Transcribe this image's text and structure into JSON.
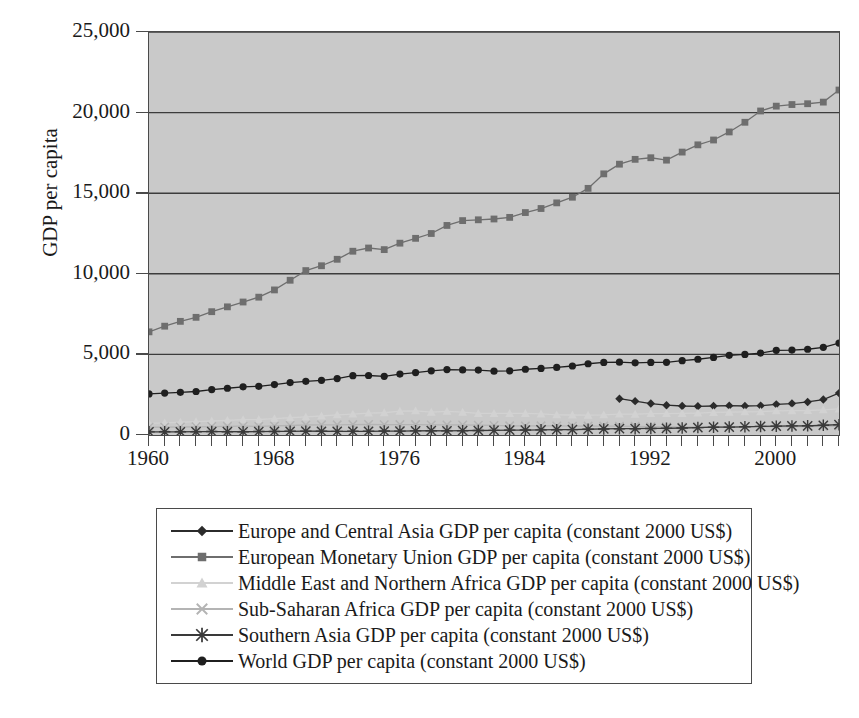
{
  "chart_data": {
    "type": "line",
    "title": "",
    "xlabel": "",
    "ylabel": "GDP per capita",
    "xlim": [
      1960,
      2004
    ],
    "ylim": [
      0,
      25000
    ],
    "grid": true,
    "legend_position": "bottom",
    "y_ticks": [
      "0",
      "5,000",
      "10,000",
      "15,000",
      "20,000",
      "25,000"
    ],
    "y_tick_values": [
      0,
      5000,
      10000,
      15000,
      20000,
      25000
    ],
    "x_ticks": [
      "1960",
      "1968",
      "1976",
      "1984",
      "1992",
      "2000"
    ],
    "x_tick_values": [
      1960,
      1968,
      1976,
      1984,
      1992,
      2000
    ],
    "x": [
      1960,
      1961,
      1962,
      1963,
      1964,
      1965,
      1966,
      1967,
      1968,
      1969,
      1970,
      1971,
      1972,
      1973,
      1974,
      1975,
      1976,
      1977,
      1978,
      1979,
      1980,
      1981,
      1982,
      1983,
      1984,
      1985,
      1986,
      1987,
      1988,
      1989,
      1990,
      1991,
      1992,
      1993,
      1994,
      1995,
      1996,
      1997,
      1998,
      1999,
      2000,
      2001,
      2002,
      2003,
      2004
    ],
    "series": [
      {
        "name": "Europe and Central Asia GDP per capita (constant 2000 US$)",
        "marker": "diamond",
        "color": "#2b2b2b",
        "start_year": 1990,
        "values": [
          null,
          null,
          null,
          null,
          null,
          null,
          null,
          null,
          null,
          null,
          null,
          null,
          null,
          null,
          null,
          null,
          null,
          null,
          null,
          null,
          null,
          null,
          null,
          null,
          null,
          null,
          null,
          null,
          null,
          null,
          2250,
          2100,
          1950,
          1850,
          1800,
          1780,
          1800,
          1820,
          1800,
          1820,
          1900,
          1950,
          2050,
          2200,
          2600
        ]
      },
      {
        "name": "European Monetary Union GDP per capita (constant 2000 US$)",
        "marker": "square",
        "color": "#6e6e6e",
        "start_year": 1960,
        "values": [
          6400,
          6750,
          7050,
          7300,
          7650,
          7950,
          8250,
          8550,
          9000,
          9600,
          10200,
          10500,
          10900,
          11400,
          11600,
          11500,
          11900,
          12200,
          12500,
          13000,
          13300,
          13350,
          13400,
          13500,
          13800,
          14050,
          14400,
          14750,
          15300,
          16200,
          16800,
          17100,
          17200,
          17050,
          17550,
          18000,
          18300,
          18800,
          19400,
          20100,
          20400,
          20500,
          20550,
          20650,
          21400
        ]
      },
      {
        "name": "Middle East and Northern Africa GDP per capita (constant 2000 US$)",
        "marker": "triangle",
        "color": "#d2d2d2",
        "start_year": 1960,
        "values": [
          720,
          750,
          790,
          830,
          870,
          910,
          950,
          960,
          1020,
          1070,
          1120,
          1180,
          1250,
          1300,
          1360,
          1380,
          1480,
          1500,
          1420,
          1470,
          1420,
          1340,
          1340,
          1340,
          1340,
          1310,
          1250,
          1240,
          1230,
          1250,
          1300,
          1290,
          1330,
          1330,
          1340,
          1360,
          1400,
          1420,
          1440,
          1450,
          1500,
          1510,
          1520,
          1560,
          1620
        ]
      },
      {
        "name": "Sub-Saharan Africa GDP per capita (constant 2000 US$)",
        "marker": "x",
        "color": "#b4b4b4",
        "start_year": 1960,
        "values": [
          480,
          490,
          495,
          510,
          525,
          540,
          545,
          540,
          560,
          590,
          620,
          630,
          630,
          645,
          655,
          635,
          645,
          645,
          625,
          625,
          620,
          610,
          595,
          570,
          565,
          570,
          565,
          550,
          555,
          555,
          550,
          540,
          520,
          510,
          505,
          510,
          520,
          520,
          515,
          515,
          520,
          525,
          525,
          535,
          550
        ]
      },
      {
        "name": "Southern Asia GDP per capita (constant 2000 US$)",
        "marker": "star",
        "color": "#3a3a3a",
        "start_year": 1960,
        "values": [
          195,
          198,
          197,
          205,
          215,
          205,
          203,
          215,
          220,
          228,
          235,
          232,
          225,
          230,
          228,
          245,
          243,
          258,
          268,
          255,
          268,
          280,
          285,
          300,
          308,
          318,
          328,
          335,
          358,
          375,
          390,
          390,
          405,
          415,
          435,
          460,
          485,
          490,
          510,
          535,
          550,
          565,
          570,
          605,
          640
        ]
      },
      {
        "name": "World GDP per capita (constant 2000 US$)",
        "marker": "circle",
        "color": "#1f1f1f",
        "start_year": 1960,
        "values": [
          2550,
          2600,
          2650,
          2700,
          2820,
          2900,
          2990,
          3020,
          3130,
          3250,
          3330,
          3390,
          3500,
          3680,
          3690,
          3640,
          3780,
          3870,
          3980,
          4060,
          4040,
          4030,
          3960,
          3980,
          4080,
          4130,
          4190,
          4280,
          4420,
          4500,
          4520,
          4480,
          4500,
          4510,
          4610,
          4700,
          4810,
          4940,
          5000,
          5080,
          5250,
          5270,
          5320,
          5440,
          5700
        ]
      }
    ]
  },
  "axes": {
    "y_title": "GDP per capita"
  },
  "legend": {
    "entries": [
      {
        "label": "Europe and Central Asia GDP per capita (constant 2000 US$)",
        "marker": "diamond",
        "color": "#2b2b2b"
      },
      {
        "label": "European Monetary Union GDP per capita (constant 2000 US$)",
        "marker": "square",
        "color": "#6e6e6e"
      },
      {
        "label": "Middle East and Northern Africa GDP per capita (constant 2000 US$)",
        "marker": "triangle",
        "color": "#d2d2d2"
      },
      {
        "label": "Sub-Saharan Africa GDP per capita (constant 2000 US$)",
        "marker": "x",
        "color": "#b4b4b4"
      },
      {
        "label": "Southern Asia GDP per capita (constant 2000 US$)",
        "marker": "star",
        "color": "#3a3a3a"
      },
      {
        "label": "World GDP per capita (constant 2000 US$)",
        "marker": "circle",
        "color": "#1f1f1f"
      }
    ]
  },
  "colors": {
    "plot_background": "#c9c9c9",
    "page_background": "#ffffff",
    "axis": "#4a4a4a",
    "gridline": "#3c3c3c",
    "text": "#1a1a1a"
  }
}
